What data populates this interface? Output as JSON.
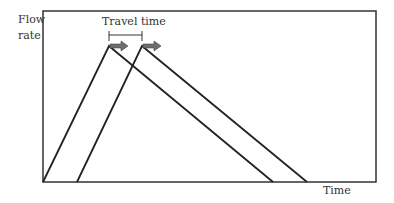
{
  "diagram": {
    "y_axis_label_line1": "Flow",
    "y_axis_label_line2": "rate",
    "x_axis_label": "Time",
    "annotation": "Travel time",
    "hydrographs": [
      {
        "name": "upstream",
        "start_x": 43,
        "peak_x": 109,
        "peak_y": 46,
        "end_x": 273
      },
      {
        "name": "downstream",
        "start_x": 77,
        "peak_x": 142,
        "peak_y": 46,
        "end_x": 307
      }
    ],
    "colors": {
      "line": "#222222",
      "arrow": "#6e6e6e",
      "frame": "#333333"
    }
  }
}
